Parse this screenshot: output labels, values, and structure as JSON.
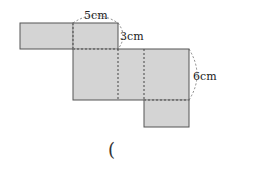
{
  "figure": {
    "type": "cuboid-net",
    "fill_color": "#d4d4d4",
    "stroke_color": "#555555",
    "labels": {
      "top_width": "5cm",
      "side_depth": "3cm",
      "right_height": "6cm"
    },
    "answer_paren": "("
  }
}
